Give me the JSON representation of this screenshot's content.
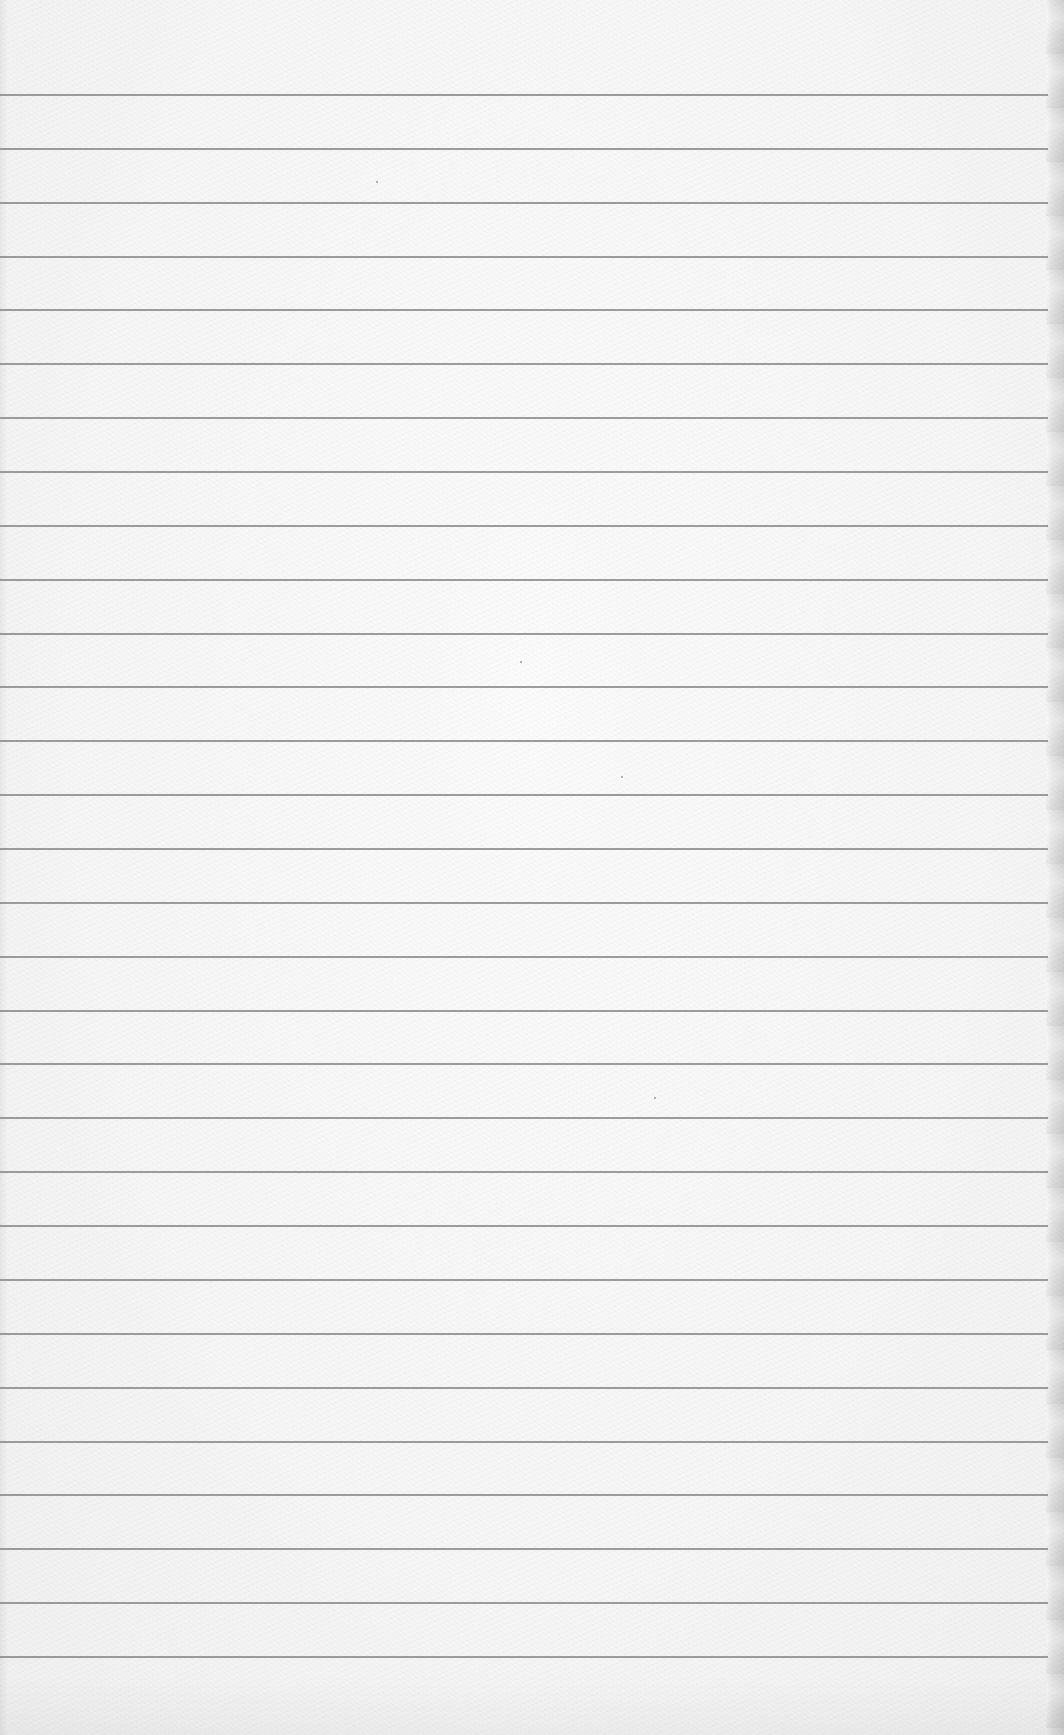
{
  "page": {
    "type": "blank lined paper",
    "background_color": "#f5f5f5",
    "line_color": "#8c8c8c",
    "line_count": 30,
    "first_line_y": 94,
    "line_spacing": 53.86,
    "line_extent_x": [
      0,
      1048
    ],
    "edge_shadow": "right"
  },
  "specks": [
    {
      "x": 376,
      "y": 181
    },
    {
      "x": 520,
      "y": 661
    },
    {
      "x": 621,
      "y": 776
    },
    {
      "x": 654,
      "y": 1097
    }
  ]
}
